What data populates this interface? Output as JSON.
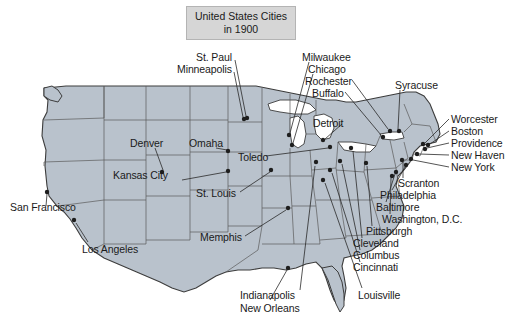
{
  "figure": {
    "title_line1": "United States Cities",
    "title_line2": "in 1900",
    "title_box_fill": "#d6d6d6",
    "title_box_border": "#b4b4b4",
    "background": "#ffffff",
    "land_fill": "#b9c2cc",
    "land_stroke": "#3c3c3c",
    "state_stroke": "#5a5a5a",
    "water_fill": "#ffffff",
    "dot_color": "#1e1e1e",
    "leader_color": "#2a2a2a",
    "label_color": "#1a1a1a"
  },
  "cities": [
    {
      "name": "St. Paul",
      "label_x": 196,
      "label_y": 52,
      "align": "left",
      "dot_x": 247,
      "dot_y": 118,
      "leader": [
        [
          235,
          60
        ],
        [
          246,
          116
        ]
      ]
    },
    {
      "name": "Minneapolis",
      "label_x": 177,
      "label_y": 64,
      "align": "left",
      "dot_x": 244,
      "dot_y": 119,
      "leader": [
        [
          234,
          72
        ],
        [
          243,
          117
        ]
      ]
    },
    {
      "name": "Milwaukee",
      "label_x": 302,
      "label_y": 52,
      "align": "left",
      "dot_x": 289,
      "dot_y": 135,
      "leader": [
        [
          309,
          62
        ],
        [
          290,
          133
        ]
      ]
    },
    {
      "name": "Chicago",
      "label_x": 308,
      "label_y": 64,
      "align": "left",
      "dot_x": 292,
      "dot_y": 145,
      "leader": [
        [
          313,
          74
        ],
        [
          293,
          143
        ]
      ]
    },
    {
      "name": "Rochester",
      "label_x": 305,
      "label_y": 76,
      "align": "left",
      "dot_x": 390,
      "dot_y": 131,
      "leader": [
        [
          352,
          80
        ],
        [
          388,
          129
        ]
      ]
    },
    {
      "name": "Buffalo",
      "label_x": 312,
      "label_y": 88,
      "align": "left",
      "dot_x": 383,
      "dot_y": 137,
      "leader": [
        [
          345,
          92
        ],
        [
          381,
          135
        ]
      ]
    },
    {
      "name": "Syracuse",
      "label_x": 395,
      "label_y": 80,
      "align": "left",
      "dot_x": 399,
      "dot_y": 131,
      "leader": [
        [
          400,
          90
        ],
        [
          398,
          129
        ]
      ]
    },
    {
      "name": "Detroit",
      "label_x": 313,
      "label_y": 118,
      "align": "left",
      "dot_x": 323,
      "dot_y": 140,
      "leader": [
        [
          342,
          124
        ],
        [
          325,
          139
        ]
      ]
    },
    {
      "name": "Worcester",
      "label_x": 451,
      "label_y": 114,
      "align": "left",
      "dot_x": 423,
      "dot_y": 144,
      "leader": [
        [
          449,
          119
        ],
        [
          425,
          143
        ]
      ]
    },
    {
      "name": "Boston",
      "label_x": 451,
      "label_y": 126,
      "align": "left",
      "dot_x": 428,
      "dot_y": 145,
      "leader": [
        [
          449,
          131
        ],
        [
          430,
          144
        ]
      ]
    },
    {
      "name": "Providence",
      "label_x": 451,
      "label_y": 138,
      "align": "left",
      "dot_x": 425,
      "dot_y": 149,
      "leader": [
        [
          449,
          143
        ],
        [
          427,
          148
        ]
      ]
    },
    {
      "name": "New Haven",
      "label_x": 451,
      "label_y": 150,
      "align": "left",
      "dot_x": 417,
      "dot_y": 154,
      "leader": [
        [
          449,
          155
        ],
        [
          419,
          154
        ]
      ]
    },
    {
      "name": "New York",
      "label_x": 451,
      "label_y": 162,
      "align": "left",
      "dot_x": 411,
      "dot_y": 159,
      "leader": [
        [
          449,
          167
        ],
        [
          413,
          160
        ]
      ]
    },
    {
      "name": "Scranton",
      "label_x": 398,
      "label_y": 178,
      "align": "left",
      "dot_x": 402,
      "dot_y": 160,
      "leader": [
        [
          403,
          178
        ],
        [
          403,
          162
        ]
      ]
    },
    {
      "name": "Philadelphia",
      "label_x": 380,
      "label_y": 190,
      "align": "left",
      "dot_x": 406,
      "dot_y": 165,
      "leader": [
        [
          392,
          190
        ],
        [
          405,
          167
        ]
      ]
    },
    {
      "name": "Baltimore",
      "label_x": 376,
      "label_y": 202,
      "align": "left",
      "dot_x": 396,
      "dot_y": 172,
      "leader": [
        [
          386,
          202
        ],
        [
          395,
          174
        ]
      ]
    },
    {
      "name": "Washington, D.C.",
      "label_x": 382,
      "label_y": 214,
      "align": "left",
      "dot_x": 392,
      "dot_y": 176,
      "leader": [
        [
          390,
          214
        ],
        [
          391,
          178
        ]
      ]
    },
    {
      "name": "Pittsburgh",
      "label_x": 366,
      "label_y": 226,
      "align": "left",
      "dot_x": 366,
      "dot_y": 163,
      "leader": [
        [
          372,
          226
        ],
        [
          367,
          166
        ]
      ]
    },
    {
      "name": "Cleveland",
      "label_x": 353,
      "label_y": 238,
      "align": "left",
      "dot_x": 351,
      "dot_y": 148,
      "leader": [
        [
          362,
          238
        ],
        [
          353,
          151
        ]
      ]
    },
    {
      "name": "Columbus",
      "label_x": 353,
      "label_y": 250,
      "align": "left",
      "dot_x": 340,
      "dot_y": 161,
      "leader": [
        [
          360,
          250
        ],
        [
          342,
          164
        ]
      ]
    },
    {
      "name": "Cincinnati",
      "label_x": 353,
      "label_y": 262,
      "align": "left",
      "dot_x": 330,
      "dot_y": 170,
      "leader": [
        [
          360,
          262
        ],
        [
          332,
          173
        ]
      ]
    },
    {
      "name": "Louisville",
      "label_x": 358,
      "label_y": 290,
      "align": "left",
      "dot_x": 323,
      "dot_y": 180,
      "leader": [
        [
          362,
          288
        ],
        [
          325,
          183
        ]
      ]
    },
    {
      "name": "Indianapolis",
      "label_x": 240,
      "label_y": 290,
      "align": "left",
      "dot_x": 316,
      "dot_y": 162,
      "leader": [
        [
          300,
          290
        ],
        [
          315,
          166
        ]
      ]
    },
    {
      "name": "New Orleans",
      "label_x": 240,
      "label_y": 303,
      "align": "left",
      "dot_x": 288,
      "dot_y": 268,
      "leader": [
        [
          270,
          300
        ],
        [
          287,
          270
        ]
      ]
    },
    {
      "name": "Memphis",
      "label_x": 200,
      "label_y": 232,
      "align": "left",
      "dot_x": 288,
      "dot_y": 208,
      "leader": [
        [
          245,
          236
        ],
        [
          286,
          210
        ]
      ]
    },
    {
      "name": "St. Louis",
      "label_x": 196,
      "label_y": 188,
      "align": "left",
      "dot_x": 271,
      "dot_y": 170,
      "leader": [
        [
          240,
          192
        ],
        [
          270,
          172
        ]
      ]
    },
    {
      "name": "Kansas City",
      "label_x": 113,
      "label_y": 170,
      "align": "left",
      "dot_x": 228,
      "dot_y": 171,
      "leader": [
        [
          182,
          180
        ],
        [
          226,
          172
        ]
      ]
    },
    {
      "name": "Denver",
      "label_x": 130,
      "label_y": 138,
      "align": "left",
      "dot_x": 162,
      "dot_y": 172,
      "leader": [
        [
          155,
          148
        ],
        [
          163,
          170
        ]
      ]
    },
    {
      "name": "Omaha",
      "label_x": 189,
      "label_y": 138,
      "align": "left",
      "dot_x": 228,
      "dot_y": 151,
      "leader": [
        [
          216,
          148
        ],
        [
          227,
          150
        ]
      ]
    },
    {
      "name": "Toledo",
      "label_x": 238,
      "label_y": 152,
      "align": "left",
      "dot_x": 330,
      "dot_y": 147,
      "leader": [
        [
          266,
          156
        ],
        [
          328,
          148
        ]
      ]
    },
    {
      "name": "San Francisco",
      "label_x": 10,
      "label_y": 202,
      "align": "left",
      "dot_x": 47,
      "dot_y": 192,
      "leader": [
        [
          46,
          206
        ],
        [
          47,
          194
        ]
      ]
    },
    {
      "name": "Los Angeles",
      "label_x": 82,
      "label_y": 244,
      "align": "left",
      "dot_x": 74,
      "dot_y": 220,
      "leader": [
        [
          88,
          242
        ],
        [
          76,
          223
        ]
      ]
    }
  ]
}
